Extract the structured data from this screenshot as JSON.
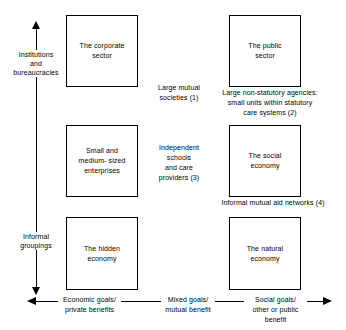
{
  "diagram": {
    "boxes": {
      "corporate": "The corporate\nsector",
      "public": "The public\nsector",
      "sme": "Small and\nmedium- sized\nenterprises",
      "social": "The social\neconomy",
      "hidden": "The hidden\neconomy",
      "natural": "The natural\neconomy"
    },
    "interstitial_labels": {
      "mutual_societies": "Large mutual\nsocieties (1)",
      "non_statutory": "Large non-statutory agencies:\nsmall units within statutory\ncare systems (2)",
      "independent_schools": "Independent\nschools\nand care\nproviders  (3)",
      "informal_aid": "Informal mutual aid networks  (4)"
    },
    "vertical_axis": {
      "top_label": "Institutions\nand\nbureaucracies",
      "bottom_label": "Informal\ngroupings"
    },
    "horizontal_axis": {
      "left_label": "Economic goals/\nprivate benefits",
      "middle_label": "Mixed goals/\nmutual benefit",
      "right_label": "Social goals/\nother or public benefit"
    },
    "colors": {
      "line": "#000000",
      "background": "#ffffff",
      "text": "#000000"
    }
  }
}
